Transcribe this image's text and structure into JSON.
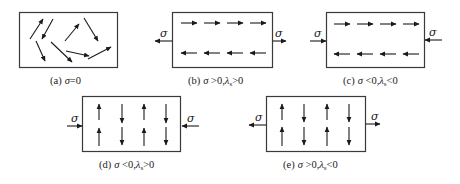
{
  "figure": {
    "panels": [
      {
        "id": "a",
        "caption": {
          "label": "(a)",
          "sym": "σ",
          "rest": "=0"
        },
        "stress": "none",
        "domains": "random"
      },
      {
        "id": "b",
        "caption": {
          "label": "(b)",
          "sym": "σ",
          "rest": " >0,",
          "lam": "λ",
          "sub": "s",
          "rest2": ">0"
        },
        "stress": "tension",
        "stress_label": "σ",
        "domains": "horizontal-antiparallel"
      },
      {
        "id": "c",
        "caption": {
          "label": "(c)",
          "sym": "σ",
          "rest": " <0,",
          "lam": "λ",
          "sub": "s",
          "rest2": "<0"
        },
        "stress": "compression",
        "stress_label": "σ",
        "domains": "horizontal-antiparallel"
      },
      {
        "id": "d",
        "caption": {
          "label": "(d)",
          "sym": "σ",
          "rest": " <0,",
          "lam": "λ",
          "sub": "s",
          "rest2": ">0"
        },
        "stress": "compression",
        "stress_label": "σ",
        "domains": "vertical-antiparallel"
      },
      {
        "id": "e",
        "caption": {
          "label": "(e)",
          "sym": "σ",
          "rest": " >0,",
          "lam": "λ",
          "sub": "s",
          "rest2": "<0"
        },
        "stress": "tension",
        "stress_label": "σ",
        "domains": "vertical-antiparallel"
      }
    ],
    "colors": {
      "line": "#1a1a1a",
      "border": "#3a3a3a",
      "background": "#ffffff"
    }
  }
}
